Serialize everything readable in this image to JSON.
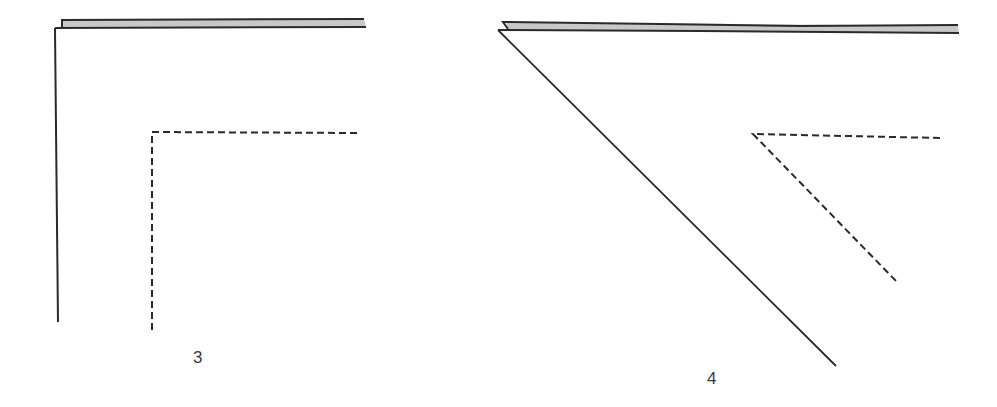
{
  "colors": {
    "stroke": "#2a2a2a",
    "band_fill": "#c8c8c8",
    "background": "#ffffff"
  },
  "figures": [
    {
      "label": "3",
      "description": "Folded edge with right-angle corner; dashed right-angle fold line inside",
      "band": {
        "top_start": [
          62,
          20
        ],
        "top_end": [
          364,
          19
        ],
        "bottom_start": [
          55,
          28
        ],
        "bottom_end": [
          366,
          27
        ]
      },
      "solid_edge": {
        "from": [
          55,
          30
        ],
        "to": [
          58,
          322
        ]
      },
      "dashed_line": {
        "corner": [
          152,
          132
        ],
        "horizontal_end": [
          357,
          133
        ],
        "vertical_end": [
          152,
          334
        ]
      }
    },
    {
      "label": "4",
      "description": "Folded edge with diagonal fold; dashed diagonal fold line inside",
      "band": {
        "top_start": [
          506,
          22
        ],
        "top_end": [
          958,
          26
        ],
        "bottom_start": [
          498,
          30
        ],
        "bottom_end": [
          959,
          33
        ]
      },
      "solid_edge": {
        "from": [
          498,
          30
        ],
        "to": [
          836,
          366
        ]
      },
      "dashed_line": {
        "corner": [
          753,
          134
        ],
        "horizontal_end": [
          940,
          138
        ],
        "diagonal_end": [
          897,
          282
        ]
      }
    }
  ]
}
